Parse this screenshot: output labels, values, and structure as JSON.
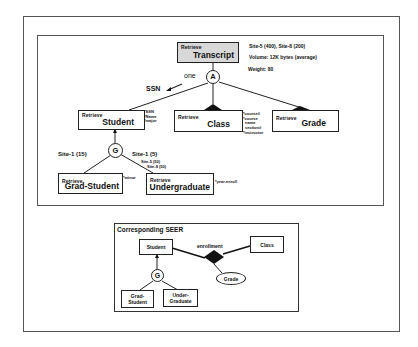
{
  "diagram": {
    "top": {
      "retrieve_label": "Retrieve",
      "root": {
        "name": "Transcript",
        "info": [
          "Site-5 (400), Site-8 (200)",
          "Volume: 12K bytes (average)",
          "Weight: 80"
        ],
        "aggregation_symbol": "A"
      },
      "edge_labels": {
        "one": "one",
        "ssn": "SSN"
      },
      "entities": {
        "student": {
          "name": "Student",
          "attributes": [
            "*SSN",
            "*Name",
            "*major"
          ]
        },
        "class": {
          "name": "Class",
          "attributes": [
            "*course#",
            "*course",
            "name",
            "section#",
            "*instructor"
          ]
        },
        "grade": {
          "name": "Grade"
        },
        "grad_student": {
          "name": "Grad-Student",
          "attributes": [
            "*minor"
          ]
        },
        "undergraduate": {
          "name": "Undergraduate",
          "attributes": [
            "*year-enroll"
          ]
        }
      },
      "generalization_symbol": "G",
      "site_labels": {
        "grad": "Site-1 (15)",
        "under": "Site-1 (5)",
        "under_extra": [
          "Site-5 (50)",
          "Site-8 (50)"
        ]
      }
    },
    "seer": {
      "title": "Corresponding SEER",
      "student": "Student",
      "class": "Class",
      "relationship": "enrollment",
      "attribute": "Grade",
      "generalization_symbol": "G",
      "grad_student": [
        "Grad-",
        "Student"
      ],
      "undergraduate": [
        "Under-",
        "Graduate"
      ]
    }
  }
}
